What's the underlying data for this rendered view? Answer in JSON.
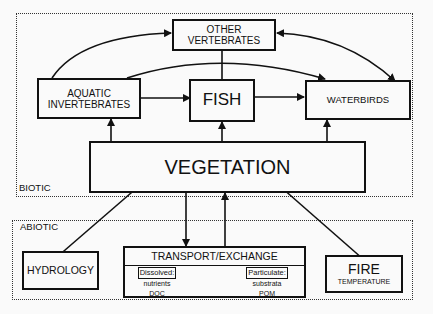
{
  "regions": {
    "biotic": {
      "label": "BIOTIC"
    },
    "abiotic": {
      "label": "ABIOTIC"
    }
  },
  "nodes": {
    "other_vertebrates": {
      "line1": "OTHER",
      "line2": "VERTEBRATES"
    },
    "aquatic_invertebrates": {
      "line1": "AQUATIC",
      "line2": "INVERTEBRATES"
    },
    "fish": {
      "label": "FISH"
    },
    "waterbirds": {
      "label": "WATERBIRDS"
    },
    "vegetation": {
      "label": "VEGETATION"
    },
    "hydrology": {
      "label": "HYDROLOGY"
    },
    "transport": {
      "label": "TRANSPORT/EXCHANGE",
      "dissolved": {
        "title": "Dissolved:",
        "items": [
          "nutrients",
          "DOC"
        ]
      },
      "particulate": {
        "title": "Particulate:",
        "items": [
          "substrata",
          "POM"
        ]
      }
    },
    "fire": {
      "label": "FIRE",
      "sublabel": "TEMPERATURE"
    }
  },
  "edges": [
    {
      "from": "AQUATIC INVERTEBRATES",
      "to": "OTHER VERTEBRATES",
      "type": "curved arrow"
    },
    {
      "from": "AQUATIC INVERTEBRATES",
      "to": "WATERBIRDS",
      "type": "curved arrow"
    },
    {
      "from": "OTHER VERTEBRATES",
      "to": "WATERBIRDS",
      "type": "bidirectional curved arrow"
    },
    {
      "from": "OTHER VERTEBRATES",
      "to": "FISH",
      "type": "line"
    },
    {
      "from": "AQUATIC INVERTEBRATES",
      "to": "FISH",
      "type": "arrow"
    },
    {
      "from": "FISH",
      "to": "WATERBIRDS",
      "type": "arrow"
    },
    {
      "from": "VEGETATION",
      "to": "AQUATIC INVERTEBRATES",
      "type": "arrow"
    },
    {
      "from": "VEGETATION",
      "to": "FISH",
      "type": "arrow"
    },
    {
      "from": "VEGETATION",
      "to": "WATERBIRDS",
      "type": "arrow"
    },
    {
      "from": "HYDROLOGY",
      "to": "VEGETATION",
      "type": "arrow"
    },
    {
      "from": "FIRE",
      "to": "VEGETATION",
      "type": "arrow"
    },
    {
      "from": "VEGETATION",
      "to": "TRANSPORT/EXCHANGE",
      "type": "arrow"
    },
    {
      "from": "TRANSPORT/EXCHANGE",
      "to": "VEGETATION",
      "type": "arrow"
    }
  ]
}
